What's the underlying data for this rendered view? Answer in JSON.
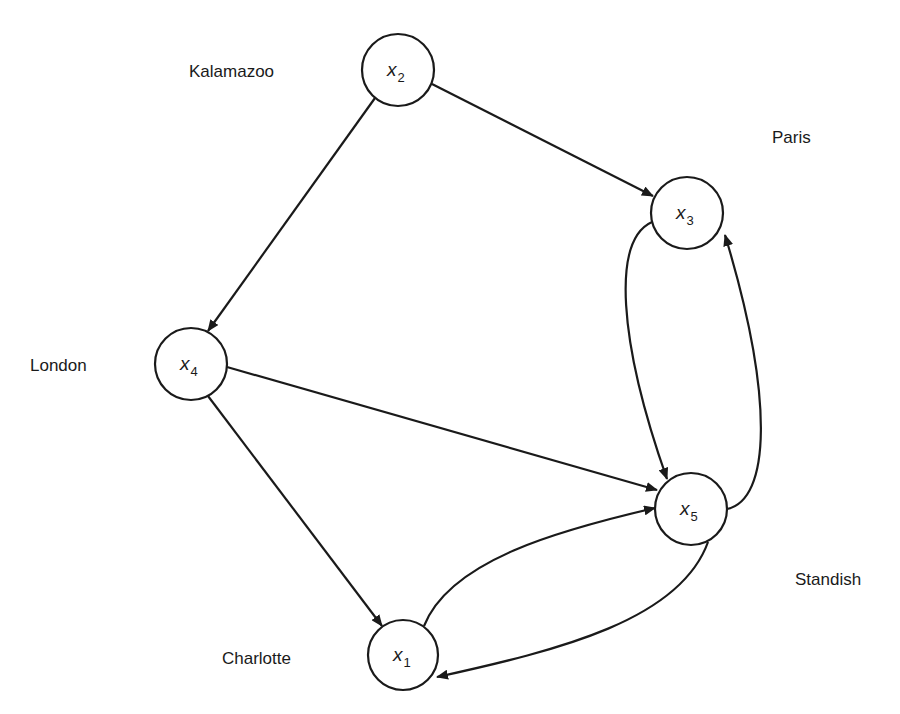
{
  "diagram": {
    "type": "directed-graph",
    "stroke_color": "#1a1a1a",
    "background": "#ffffff",
    "nodes": [
      {
        "id": "x2",
        "var": "x",
        "sub": "2",
        "city": "Kalamazoo",
        "cx": 398,
        "cy": 70,
        "r": 36
      },
      {
        "id": "x3",
        "var": "x",
        "sub": "3",
        "city": "Paris",
        "cx": 687,
        "cy": 213,
        "r": 36
      },
      {
        "id": "x4",
        "var": "x",
        "sub": "4",
        "city": "London",
        "cx": 191,
        "cy": 364,
        "r": 36
      },
      {
        "id": "x5",
        "var": "x",
        "sub": "5",
        "city": "Standish",
        "cx": 691,
        "cy": 509,
        "r": 36
      },
      {
        "id": "x1",
        "var": "x",
        "sub": "1",
        "city": "Charlotte",
        "cx": 403,
        "cy": 655,
        "r": 35
      }
    ],
    "labels": {
      "kalamazoo": "Kalamazoo",
      "paris": "Paris",
      "london": "London",
      "standish": "Standish",
      "charlotte": "Charlotte"
    },
    "edges": [
      {
        "from": "x2",
        "to": "x3",
        "shape": "straight"
      },
      {
        "from": "x2",
        "to": "x4",
        "shape": "straight"
      },
      {
        "from": "x4",
        "to": "x5",
        "shape": "straight"
      },
      {
        "from": "x4",
        "to": "x1",
        "shape": "straight"
      },
      {
        "from": "x3",
        "to": "x5",
        "shape": "curved"
      },
      {
        "from": "x5",
        "to": "x3",
        "shape": "curved"
      },
      {
        "from": "x1",
        "to": "x5",
        "shape": "curved"
      },
      {
        "from": "x5",
        "to": "x1",
        "shape": "curved"
      }
    ]
  }
}
